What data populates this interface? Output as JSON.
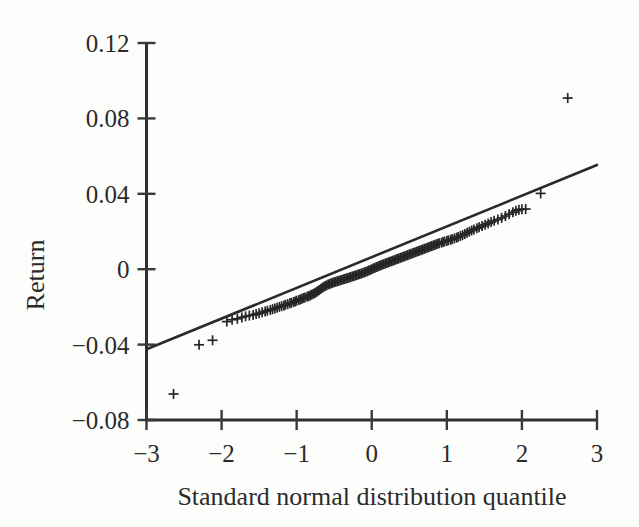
{
  "chart_data": {
    "type": "scatter",
    "title": "",
    "subtitle": "",
    "xlabel": "Standard normal distribution quantile",
    "ylabel": "Return",
    "xlim": [
      -3,
      3
    ],
    "ylim": [
      -0.08,
      0.12
    ],
    "xticks": [
      -3,
      -2,
      -1,
      0,
      1,
      2,
      3
    ],
    "xticklabels": [
      "−3",
      "−2",
      "−1",
      "0",
      "1",
      "2",
      "3"
    ],
    "yticks": [
      -0.08,
      -0.04,
      0,
      0.04,
      0.08,
      0.12
    ],
    "yticklabels": [
      "−0.08",
      "−0.04",
      "0",
      "0.04",
      "0.08",
      "0.12"
    ],
    "grid": false,
    "legend": null,
    "marker": "plus",
    "marker_color": "#262626",
    "line_color": "#2a2a2a",
    "reference_line": {
      "name": "fitted normal reference line",
      "x": [
        -3,
        3
      ],
      "y": [
        -0.0425,
        0.0553
      ]
    },
    "series": [
      {
        "name": "Return quantiles",
        "points": [
          [
            -2.64,
            -0.0662
          ],
          [
            -2.3,
            -0.0401
          ],
          [
            -2.12,
            -0.0377
          ],
          [
            -1.93,
            -0.0278
          ],
          [
            -1.86,
            -0.0268
          ],
          [
            -1.79,
            -0.0263
          ],
          [
            -1.73,
            -0.0256
          ],
          [
            -1.68,
            -0.025
          ],
          [
            -1.63,
            -0.0246
          ],
          [
            -1.58,
            -0.0243
          ],
          [
            -1.54,
            -0.0238
          ],
          [
            -1.5,
            -0.0234
          ],
          [
            -1.46,
            -0.0229
          ],
          [
            -1.42,
            -0.0224
          ],
          [
            -1.39,
            -0.022
          ],
          [
            -1.35,
            -0.0216
          ],
          [
            -1.32,
            -0.0212
          ],
          [
            -1.29,
            -0.0208
          ],
          [
            -1.26,
            -0.0204
          ],
          [
            -1.23,
            -0.02
          ],
          [
            -1.2,
            -0.0196
          ],
          [
            -1.17,
            -0.0192
          ],
          [
            -1.15,
            -0.0189
          ],
          [
            -1.12,
            -0.0185
          ],
          [
            -1.09,
            -0.0181
          ],
          [
            -1.07,
            -0.0178
          ],
          [
            -1.04,
            -0.0174
          ],
          [
            -1.02,
            -0.0171
          ],
          [
            -1.0,
            -0.0167
          ],
          [
            -0.97,
            -0.0164
          ],
          [
            -0.95,
            -0.016
          ],
          [
            -0.93,
            -0.0157
          ],
          [
            -0.91,
            -0.0153
          ],
          [
            -0.89,
            -0.015
          ],
          [
            -0.86,
            -0.0146
          ],
          [
            -0.84,
            -0.0143
          ],
          [
            -0.82,
            -0.0139
          ],
          [
            -0.8,
            -0.0135
          ],
          [
            -0.78,
            -0.0131
          ],
          [
            -0.76,
            -0.0127
          ],
          [
            -0.74,
            -0.0122
          ],
          [
            -0.72,
            -0.0117
          ],
          [
            -0.7,
            -0.0111
          ],
          [
            -0.68,
            -0.0105
          ],
          [
            -0.66,
            -0.0099
          ],
          [
            -0.64,
            -0.0094
          ],
          [
            -0.62,
            -0.0089
          ],
          [
            -0.6,
            -0.0085
          ],
          [
            -0.58,
            -0.0081
          ],
          [
            -0.56,
            -0.0078
          ],
          [
            -0.54,
            -0.0075
          ],
          [
            -0.52,
            -0.0072
          ],
          [
            -0.5,
            -0.0069
          ],
          [
            -0.48,
            -0.0067
          ],
          [
            -0.46,
            -0.0064
          ],
          [
            -0.44,
            -0.0062
          ],
          [
            -0.42,
            -0.0059
          ],
          [
            -0.4,
            -0.0057
          ],
          [
            -0.38,
            -0.0054
          ],
          [
            -0.36,
            -0.0052
          ],
          [
            -0.34,
            -0.0049
          ],
          [
            -0.32,
            -0.0047
          ],
          [
            -0.3,
            -0.0044
          ],
          [
            -0.28,
            -0.0042
          ],
          [
            -0.26,
            -0.0039
          ],
          [
            -0.24,
            -0.0036
          ],
          [
            -0.22,
            -0.0034
          ],
          [
            -0.2,
            -0.0031
          ],
          [
            -0.18,
            -0.0028
          ],
          [
            -0.16,
            -0.0026
          ],
          [
            -0.14,
            -0.0023
          ],
          [
            -0.12,
            -0.002
          ],
          [
            -0.1,
            -0.0017
          ],
          [
            -0.08,
            -0.0014
          ],
          [
            -0.06,
            -0.0011
          ],
          [
            -0.04,
            -0.0007
          ],
          [
            -0.02,
            -0.0004
          ],
          [
            0.0,
            0.0
          ],
          [
            0.02,
            0.0004
          ],
          [
            0.04,
            0.0007
          ],
          [
            0.06,
            0.0011
          ],
          [
            0.08,
            0.0014
          ],
          [
            0.1,
            0.0017
          ],
          [
            0.12,
            0.0021
          ],
          [
            0.14,
            0.0024
          ],
          [
            0.16,
            0.0027
          ],
          [
            0.18,
            0.003
          ],
          [
            0.2,
            0.0033
          ],
          [
            0.22,
            0.0036
          ],
          [
            0.24,
            0.0039
          ],
          [
            0.26,
            0.0042
          ],
          [
            0.28,
            0.0045
          ],
          [
            0.3,
            0.0048
          ],
          [
            0.32,
            0.0051
          ],
          [
            0.34,
            0.0054
          ],
          [
            0.36,
            0.0057
          ],
          [
            0.38,
            0.006
          ],
          [
            0.4,
            0.0063
          ],
          [
            0.42,
            0.0066
          ],
          [
            0.44,
            0.0069
          ],
          [
            0.46,
            0.0072
          ],
          [
            0.48,
            0.0075
          ],
          [
            0.5,
            0.0078
          ],
          [
            0.52,
            0.0081
          ],
          [
            0.54,
            0.0084
          ],
          [
            0.56,
            0.0087
          ],
          [
            0.58,
            0.009
          ],
          [
            0.6,
            0.0093
          ],
          [
            0.62,
            0.0096
          ],
          [
            0.64,
            0.0099
          ],
          [
            0.66,
            0.0102
          ],
          [
            0.68,
            0.0105
          ],
          [
            0.7,
            0.0108
          ],
          [
            0.72,
            0.0111
          ],
          [
            0.74,
            0.0114
          ],
          [
            0.76,
            0.0117
          ],
          [
            0.78,
            0.012
          ],
          [
            0.8,
            0.0123
          ],
          [
            0.82,
            0.0126
          ],
          [
            0.84,
            0.0129
          ],
          [
            0.86,
            0.0132
          ],
          [
            0.88,
            0.0135
          ],
          [
            0.9,
            0.0138
          ],
          [
            0.93,
            0.0141
          ],
          [
            0.95,
            0.0144
          ],
          [
            0.97,
            0.0147
          ],
          [
            1.0,
            0.015
          ],
          [
            1.02,
            0.0153
          ],
          [
            1.05,
            0.0156
          ],
          [
            1.07,
            0.0159
          ],
          [
            1.1,
            0.0163
          ],
          [
            1.13,
            0.0167
          ],
          [
            1.15,
            0.0171
          ],
          [
            1.18,
            0.0176
          ],
          [
            1.21,
            0.0181
          ],
          [
            1.24,
            0.0187
          ],
          [
            1.27,
            0.0193
          ],
          [
            1.3,
            0.0199
          ],
          [
            1.33,
            0.0205
          ],
          [
            1.36,
            0.0211
          ],
          [
            1.4,
            0.0217
          ],
          [
            1.43,
            0.0223
          ],
          [
            1.47,
            0.0229
          ],
          [
            1.51,
            0.0236
          ],
          [
            1.55,
            0.0243
          ],
          [
            1.59,
            0.025
          ],
          [
            1.63,
            0.0257
          ],
          [
            1.68,
            0.0264
          ],
          [
            1.73,
            0.0272
          ],
          [
            1.78,
            0.0282
          ],
          [
            1.83,
            0.0292
          ],
          [
            1.88,
            0.0302
          ],
          [
            1.92,
            0.031
          ],
          [
            1.96,
            0.0316
          ],
          [
            2.0,
            0.0318
          ],
          [
            2.05,
            0.0319
          ],
          [
            2.25,
            0.0402
          ],
          [
            2.61,
            0.0908
          ]
        ]
      }
    ]
  },
  "axes": {
    "y_axis_name": "Return",
    "x_axis_name": "Standard normal distribution quantile"
  }
}
